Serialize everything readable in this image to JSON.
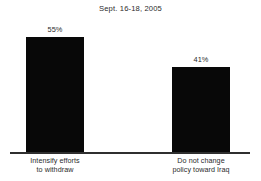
{
  "chart_data": {
    "type": "bar",
    "title": "Sept. 16-18, 2005",
    "subtitle": "",
    "xlabel": "",
    "ylabel": "",
    "ylim": [
      0,
      100
    ],
    "grid": false,
    "legend": false,
    "orientation": "vertical",
    "bar_color": "#080808",
    "background_color": "#ffffff",
    "axis_color": "#2f2f2f",
    "categories": [
      "Intensify efforts to withdraw",
      "Do not change policy toward Iraq"
    ],
    "values": [
      55,
      41
    ],
    "value_labels": [
      "55%",
      "41%"
    ],
    "category_label_lines": [
      [
        "Intensify efforts",
        "to withdraw"
      ],
      [
        "Do not change",
        "policy toward Iraq"
      ]
    ]
  }
}
